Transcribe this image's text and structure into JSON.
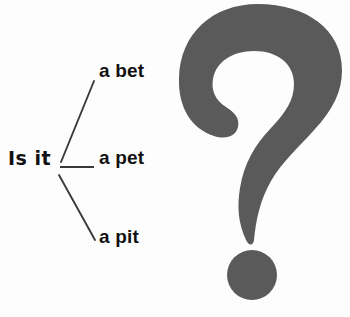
{
  "worksheet": {
    "title": "Is it a bet / a pet / a pit",
    "prompt": "Is it",
    "blank_line_label": "answer-blank",
    "options": [
      {
        "label": "a bet",
        "connector": "diagonal-up"
      },
      {
        "label": "a pet",
        "connector": "horizontal"
      },
      {
        "label": "a pit",
        "connector": "diagonal-down"
      }
    ]
  },
  "graphic": {
    "name": "question-mark",
    "icon": "question-mark-icon",
    "glyph": "?",
    "fill_color": "#5a5a5a",
    "dot_shape": "circle"
  },
  "colors": {
    "background": "#fdfdfd",
    "text": "#111111",
    "line": "#3a3a3a",
    "graphic_gray": "#5a5a5a"
  }
}
